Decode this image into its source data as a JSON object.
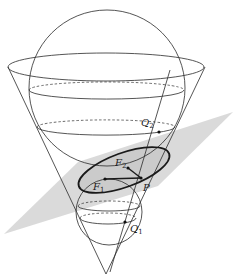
{
  "figure": {
    "type": "Dandelin spheres diagram",
    "colors": {
      "line": "#2a2a2a",
      "plane": "#d4d4d4",
      "ellipse_fill": "#c8c8c8"
    },
    "labels": {
      "q2": "Q",
      "q2_sub": "2",
      "f2": "F",
      "f2_sub": "2",
      "f1": "F",
      "f1_sub": "1",
      "p": "P",
      "q1": "Q",
      "q1_sub": "1"
    }
  }
}
